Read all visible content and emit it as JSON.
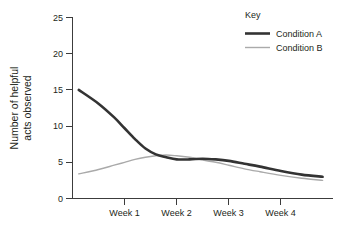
{
  "chart_data": {
    "type": "line",
    "title": "",
    "xlabel": "",
    "ylabel": "Number of helpful acts observed",
    "ylabel_line1": "Number of helpful",
    "ylabel_line2": "acts observed",
    "ylim": [
      0,
      25
    ],
    "yticks": [
      0,
      5,
      10,
      15,
      20,
      25
    ],
    "ytick_labels": [
      "0",
      "5",
      "10",
      "15",
      "20",
      "25"
    ],
    "xtick_labels": [
      "Week 1",
      "Week 2",
      "Week 3",
      "Week 4"
    ],
    "xlim": [
      0,
      5
    ],
    "xticks": [
      1,
      2,
      3,
      4
    ],
    "grid": false,
    "legend": {
      "title": "Key",
      "position": "top-right",
      "entries": [
        {
          "name": "Condition A",
          "color": "#333333",
          "width": 2.6
        },
        {
          "name": "Condition B",
          "color": "#aaaaaa",
          "width": 1.4
        }
      ]
    },
    "x": [
      0.12,
      0.5,
      0.8,
      1.0,
      1.2,
      1.4,
      1.6,
      1.8,
      2.0,
      2.25,
      2.5,
      2.75,
      3.0,
      3.3,
      3.6,
      4.0,
      4.4,
      4.8
    ],
    "series": [
      {
        "name": "Condition A",
        "color": "#333333",
        "width": 2.6,
        "values": [
          15.0,
          13.1,
          11.2,
          9.7,
          8.2,
          6.9,
          6.1,
          5.7,
          5.4,
          5.4,
          5.5,
          5.4,
          5.2,
          4.8,
          4.4,
          3.8,
          3.3,
          3.0
        ]
      },
      {
        "name": "Condition B",
        "color": "#aaaaaa",
        "width": 1.4,
        "values": [
          3.4,
          4.0,
          4.6,
          5.0,
          5.4,
          5.7,
          5.9,
          6.0,
          5.9,
          5.7,
          5.3,
          5.0,
          4.6,
          4.1,
          3.7,
          3.2,
          2.8,
          2.5
        ]
      }
    ]
  },
  "axes": {
    "y_title_line1": "Number of helpful",
    "y_title_line2": "acts observed"
  }
}
